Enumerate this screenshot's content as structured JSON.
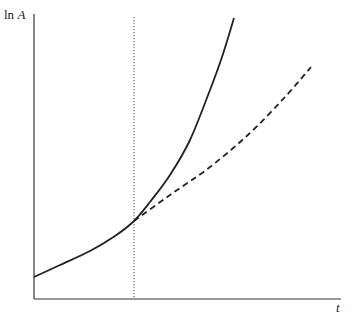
{
  "chart_data": {
    "type": "line",
    "title": "",
    "xlabel": "t",
    "ylabel": "ln A",
    "ylabel_parts": {
      "fn": "ln",
      "var": "A"
    },
    "grid": false,
    "legend": null,
    "axis_ticks": {
      "x": [],
      "y": []
    },
    "annotations": [
      {
        "type": "vertical-dotted-line",
        "description": "structural break / time of change",
        "x_px": 134
      }
    ],
    "series": [
      {
        "name": "actual path (solid)",
        "style": "solid",
        "description": "ln A grows slowly until the break, then accelerates sharply",
        "points_px": [
          [
            34,
            277
          ],
          [
            60,
            265
          ],
          [
            90,
            251
          ],
          [
            115,
            236
          ],
          [
            134,
            221
          ],
          [
            150,
            202
          ],
          [
            170,
            175
          ],
          [
            190,
            140
          ],
          [
            210,
            90
          ],
          [
            222,
            57
          ],
          [
            234,
            18
          ]
        ]
      },
      {
        "name": "counterfactual path (dashed)",
        "style": "dashed",
        "description": "continuation of the original growth path after the break",
        "points_px": [
          [
            134,
            221
          ],
          [
            170,
            195
          ],
          [
            210,
            167
          ],
          [
            250,
            133
          ],
          [
            285,
            97
          ],
          [
            311,
            67
          ]
        ]
      }
    ]
  },
  "labels": {
    "y_axis": "ln A",
    "y_fn": "ln",
    "y_var": "A",
    "x_axis": "t"
  },
  "colors": {
    "line": "#222222",
    "axis": "#333333",
    "background": "#ffffff"
  }
}
